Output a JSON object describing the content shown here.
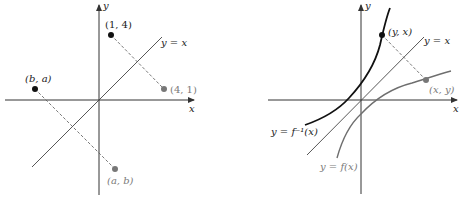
{
  "colors": {
    "axis": "#333333",
    "line": "#444444",
    "point_dark": "#111111",
    "point_gray": "#777777",
    "curve_inverse": "#111111",
    "curve_f": "#6e6e6e",
    "label_gray": "#7a7a7a"
  },
  "left_panel": {
    "axis_x_label": "x",
    "axis_y_label": "y",
    "diagonal_label": "y = x",
    "points": [
      {
        "label": "(1, 4)",
        "shade": "dark"
      },
      {
        "label": "(4, 1)",
        "shade": "gray"
      },
      {
        "label": "(b, a)",
        "shade": "dark"
      },
      {
        "label": "(a, b)",
        "shade": "gray"
      }
    ]
  },
  "right_panel": {
    "axis_x_label": "x",
    "axis_y_label": "y",
    "diagonal_label": "y = x",
    "inverse_curve_label": "y = f⁻¹(x)",
    "function_curve_label": "y = f(x)",
    "points": [
      {
        "label": "(y, x)",
        "shade": "dark"
      },
      {
        "label": "(x, y)",
        "shade": "gray"
      }
    ]
  }
}
